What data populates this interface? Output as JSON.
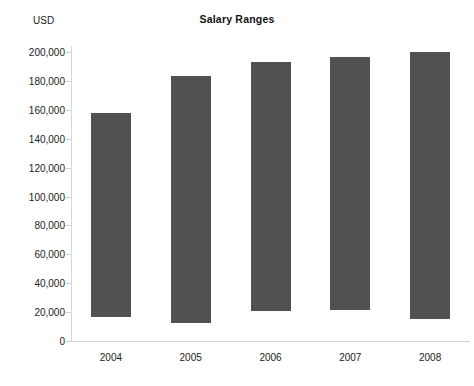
{
  "chart_data": {
    "type": "bar",
    "bar_style": "floating-range",
    "title": "Salary Ranges",
    "xlabel": "",
    "ylabel": "USD",
    "ylim": [
      0,
      200000
    ],
    "ytick_step": 20000,
    "grid": false,
    "legend": "none",
    "bar_color": "#4a4a4a",
    "background_color": "#ffffff",
    "categories": [
      "2004",
      "2005",
      "2006",
      "2007",
      "2008"
    ],
    "ytick_labels": [
      "200,000",
      "180,000",
      "160,000",
      "140,000",
      "120,000",
      "100,000",
      "80,000",
      "60,000",
      "40,000",
      "20,000",
      "0"
    ],
    "ytick_values": [
      200000,
      180000,
      160000,
      140000,
      120000,
      100000,
      80000,
      60000,
      40000,
      20000,
      0
    ],
    "series": [
      {
        "name": "Minimum salary",
        "values": [
          16600,
          12500,
          21000,
          21500,
          15500
        ]
      },
      {
        "name": "Maximum salary",
        "values": [
          157800,
          183400,
          193000,
          196500,
          200000
        ]
      }
    ],
    "bars": [
      {
        "category": "2004",
        "low": 16600,
        "high": 157800
      },
      {
        "category": "2005",
        "low": 12500,
        "high": 183400
      },
      {
        "category": "2006",
        "low": 21000,
        "high": 193000
      },
      {
        "category": "2007",
        "low": 21500,
        "high": 196500
      },
      {
        "category": "2008",
        "low": 15500,
        "high": 200000
      }
    ]
  }
}
